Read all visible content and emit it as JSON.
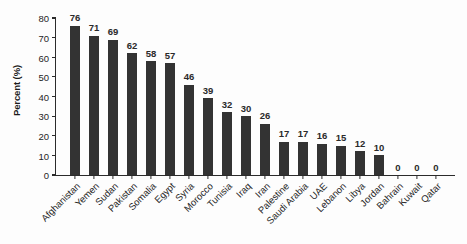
{
  "chart_data": {
    "type": "bar",
    "title": "",
    "xlabel": "",
    "ylabel": "Percent (%)",
    "ylim": [
      0,
      80
    ],
    "yticks": [
      0,
      10,
      20,
      30,
      40,
      50,
      60,
      70,
      80
    ],
    "grid": false,
    "legend": null,
    "bar_color": "#333333",
    "background_color": "#fdfdfd",
    "categories": [
      "Afghanistan",
      "Yemen",
      "Sudan",
      "Pakistan",
      "Somalia",
      "Egypt",
      "Syria",
      "Morocco",
      "Tunisia",
      "Iraq",
      "Iran",
      "Palestine",
      "Saudi Arabia",
      "UAE",
      "Lebanon",
      "Libya",
      "Jordan",
      "Bahrain",
      "Kuwait",
      "Qatar"
    ],
    "values": [
      76,
      71,
      69,
      62,
      58,
      57,
      46,
      39,
      32,
      30,
      26,
      17,
      17,
      16,
      15,
      12,
      10,
      0,
      0,
      0
    ],
    "value_labels": [
      "76",
      "71",
      "69",
      "62",
      "58",
      "57",
      "46",
      "39",
      "32",
      "30",
      "26",
      "17",
      "17",
      "16",
      "15",
      "12",
      "10",
      "0",
      "0",
      "0"
    ],
    "ytick_labels": [
      "0",
      "10",
      "20",
      "30",
      "40",
      "50",
      "60",
      "70",
      "80"
    ]
  }
}
